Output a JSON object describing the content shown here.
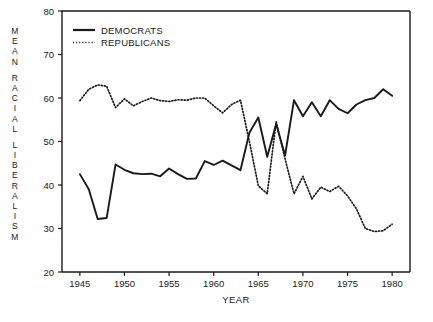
{
  "chart_data": {
    "type": "line",
    "title": "",
    "xlabel": "YEAR",
    "ylabel": "MEAN RACIAL LIBERALISM",
    "ylabel_chars": [
      "M",
      "E",
      "A",
      "N",
      "",
      "R",
      "A",
      "C",
      "I",
      "A",
      "L",
      "",
      "L",
      "I",
      "B",
      "E",
      "R",
      "A",
      "L",
      "I",
      "S",
      "M"
    ],
    "xlim": [
      1943,
      1982
    ],
    "ylim": [
      20,
      80
    ],
    "xticks": [
      1945,
      1950,
      1955,
      1960,
      1965,
      1970,
      1975,
      1980
    ],
    "xtick_labels": [
      "1945",
      "1950",
      "1955",
      "1960",
      "1965",
      "1970",
      "1975",
      "1980"
    ],
    "yticks": [
      20,
      30,
      40,
      50,
      60,
      70,
      80
    ],
    "ytick_labels": [
      "20",
      "30",
      "40",
      "50",
      "60",
      "70",
      "80"
    ],
    "grid": false,
    "legend_position": "top-left",
    "x": [
      1945,
      1946,
      1947,
      1948,
      1949,
      1950,
      1951,
      1952,
      1953,
      1954,
      1955,
      1956,
      1957,
      1958,
      1959,
      1960,
      1961,
      1962,
      1963,
      1964,
      1965,
      1966,
      1967,
      1968,
      1969,
      1970,
      1971,
      1972,
      1973,
      1974,
      1975,
      1976,
      1977,
      1978,
      1979,
      1980
    ],
    "series": [
      {
        "name": "DEMOCRATS",
        "style": "solid",
        "color": "#1a1a1a",
        "values": [
          42.5,
          39.0,
          32.2,
          32.4,
          44.7,
          43.5,
          42.7,
          42.5,
          42.6,
          42.0,
          43.8,
          42.5,
          41.4,
          41.5,
          45.5,
          44.6,
          45.6,
          44.5,
          43.4,
          52.0,
          55.5,
          46.5,
          54.0,
          46.8,
          59.5,
          55.8,
          59.0,
          55.8,
          59.5,
          57.5,
          56.5,
          58.5,
          59.5,
          60.0,
          62.0,
          60.5
        ]
      },
      {
        "name": "REPUBLICANS",
        "style": "dotted",
        "color": "#1a1a1a",
        "values": [
          59.4,
          62.0,
          63.0,
          62.7,
          57.8,
          59.8,
          58.2,
          59.2,
          60.0,
          59.4,
          59.2,
          59.6,
          59.5,
          60.0,
          60.0,
          58.2,
          56.6,
          58.5,
          59.5,
          50.0,
          39.8,
          38.0,
          54.6,
          46.0,
          38.0,
          42.0,
          36.8,
          39.5,
          38.5,
          39.7,
          37.5,
          34.5,
          30.0,
          29.3,
          29.5,
          31.0
        ]
      }
    ],
    "legend": [
      {
        "label": "DEMOCRATS",
        "style": "solid"
      },
      {
        "label": "REPUBLICANS",
        "style": "dotted"
      }
    ]
  }
}
